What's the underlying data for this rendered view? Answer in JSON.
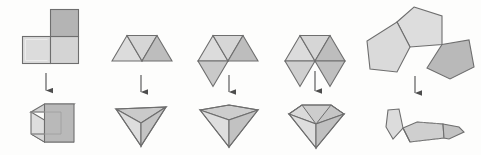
{
  "figure": {
    "width": 481,
    "height": 155,
    "background_color": "#fdfdfc",
    "colors": {
      "fill_light": "#dcdcdc",
      "fill_mid": "#cfcfcf",
      "fill_dark": "#b4b4b4",
      "fill_darker": "#a8a8a8",
      "stroke": "#6e6e6e",
      "stroke_soft": "#8a8a8a",
      "arrow": "#4d4d4d"
    },
    "columns": [
      {
        "index": 1,
        "net": {
          "name": "three-squares-l-shape",
          "polygon": "square",
          "count": 3,
          "arrangement": "L-shape: one square above right cell of a two-square row",
          "vertex_angle_sum_deg": 270
        },
        "arrow": {
          "direction": "down",
          "label": "folds into"
        },
        "solid": {
          "name": "cube-corner",
          "description": "Cube corner formed by three squares meeting at a vertex"
        }
      },
      {
        "index": 2,
        "net": {
          "name": "three-triangles-trapezoid",
          "polygon": "equilateral-triangle",
          "count": 3,
          "arrangement": "Row of three triangles (up, down, up) forming a trapezoid",
          "vertex_angle_sum_deg": 180
        },
        "arrow": {
          "direction": "down",
          "label": "folds into"
        },
        "solid": {
          "name": "triangular-pyramid-corner",
          "description": "Tetrahedron corner: three triangles meeting at a vertex"
        }
      },
      {
        "index": 3,
        "net": {
          "name": "four-triangles",
          "polygon": "equilateral-triangle",
          "count": 4,
          "arrangement": "Three triangles pointing up in a row with a fourth hanging below",
          "vertex_angle_sum_deg": 240
        },
        "arrow": {
          "direction": "down",
          "label": "folds into"
        },
        "solid": {
          "name": "square-pyramid-corner",
          "description": "Square pyramid corner: four triangles meeting at a vertex"
        }
      },
      {
        "index": 4,
        "net": {
          "name": "five-triangles",
          "polygon": "equilateral-triangle",
          "count": 5,
          "arrangement": "Three triangles pointing up with two hanging below",
          "vertex_angle_sum_deg": 300
        },
        "arrow": {
          "direction": "down",
          "label": "folds into"
        },
        "solid": {
          "name": "pentagonal-pyramid-corner",
          "description": "Pentagonal pyramid corner: five triangles meeting at a vertex"
        }
      },
      {
        "index": 5,
        "net": {
          "name": "three-pentagons",
          "polygon": "regular-pentagon",
          "count": 3,
          "arrangement": "Three pentagons meeting at a common vertex with a gap",
          "vertex_angle_sum_deg": 324
        },
        "arrow": {
          "direction": "down",
          "label": "folds into"
        },
        "solid": {
          "name": "dodecahedron-corner",
          "description": "Dodecahedron corner: three pentagons meeting at a vertex"
        }
      }
    ]
  }
}
